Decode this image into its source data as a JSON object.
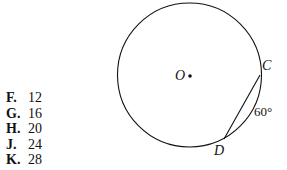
{
  "answer_choices": [
    {
      "letter": "F.",
      "value": "12"
    },
    {
      "letter": "G.",
      "value": "16"
    },
    {
      "letter": "H.",
      "value": "20"
    },
    {
      "letter": "J.",
      "value": "24"
    },
    {
      "letter": "K.",
      "value": "28"
    }
  ],
  "diagram": {
    "center_label": "O",
    "point_c_label": "C",
    "point_d_label": "D",
    "arc_label": "60°"
  }
}
